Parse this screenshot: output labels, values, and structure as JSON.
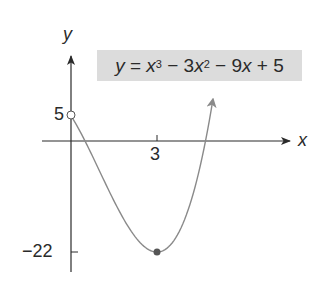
{
  "chart_data": {
    "type": "line",
    "function": "y = x^3 - 3x^2 - 9x + 5",
    "xlabel": "x",
    "ylabel": "y",
    "x_ticks": [
      3
    ],
    "y_ticks": [
      5,
      -22
    ],
    "xlim": [
      -1,
      7.5
    ],
    "ylim": [
      -25,
      14
    ],
    "domain": [
      0,
      4.95
    ],
    "open_endpoint": {
      "x": 0,
      "y": 5,
      "style": "open-circle"
    },
    "marked_point": {
      "x": 3,
      "y": -22,
      "style": "filled-dot"
    },
    "arrow_end": {
      "x": 4.95,
      "y": 8.2
    },
    "points": [
      {
        "x": 0,
        "y": 5
      },
      {
        "x": 0.5,
        "y": 0.375
      },
      {
        "x": 1,
        "y": -6
      },
      {
        "x": 1.5,
        "y": -12.125
      },
      {
        "x": 2,
        "y": -17
      },
      {
        "x": 2.5,
        "y": -20.625
      },
      {
        "x": 3,
        "y": -22
      },
      {
        "x": 3.5,
        "y": -20.125
      },
      {
        "x": 4,
        "y": -15
      },
      {
        "x": 4.5,
        "y": -5.875
      },
      {
        "x": 4.95,
        "y": 8.2
      }
    ],
    "grid": false,
    "legend": null
  },
  "labels": {
    "y_axis": "y",
    "x_axis": "x",
    "tick_x3": "3",
    "tick_y5": "5",
    "tick_ym22": "−22"
  },
  "equation": {
    "lhs": "y",
    "eq": " = ",
    "t1": "x",
    "t1_exp": "3",
    "op1": " − 3",
    "t2": "x",
    "t2_exp": "2",
    "op2": " − 9",
    "t3": "x",
    "op3": " + 5"
  },
  "colors": {
    "curve": "#8a8a8a",
    "axes": "#2a2a2a",
    "box": "#dcdcdc",
    "dot": "#555555"
  }
}
